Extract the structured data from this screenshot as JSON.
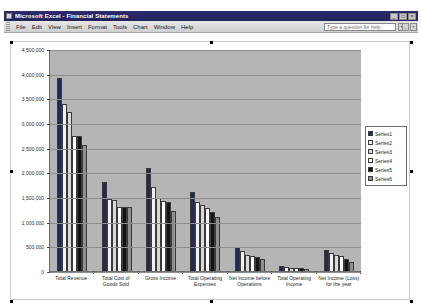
{
  "window": {
    "title": "Microsoft Excel - Financial Statements",
    "app_icon": "excel-icon",
    "minimize_label": "_",
    "restore_label": "□",
    "close_label": "×"
  },
  "menubar": {
    "items": [
      {
        "label": "File"
      },
      {
        "label": "Edit"
      },
      {
        "label": "View"
      },
      {
        "label": "Insert"
      },
      {
        "label": "Format"
      },
      {
        "label": "Tools"
      },
      {
        "label": "Chart"
      },
      {
        "label": "Window"
      },
      {
        "label": "Help"
      }
    ],
    "ask_placeholder": "Type a question for help",
    "ask_value": "Type a question for help",
    "ask_dropdown_glyph": "▾",
    "doc_minimize_label": "_",
    "doc_restore_label": "□",
    "doc_close_label": "×"
  },
  "chart_data": {
    "type": "bar",
    "title": "",
    "xlabel": "",
    "ylabel": "",
    "ylim": [
      0,
      4500000
    ],
    "ytick_step": 500000,
    "grid": true,
    "legend_position": "right",
    "ytick_labels": [
      "4,500,000",
      "4,000,000",
      "3,500,000",
      "3,000,000",
      "2,500,000",
      "2,000,000",
      "1,500,000",
      "1,000,000",
      "500,000",
      "0"
    ],
    "categories": [
      "Total Revenue",
      "Total Cost of Goods Sold",
      "Gross Income",
      "Total Operating Expenses",
      "Net Income before Operations",
      "Total Operating Income",
      "Net Income (Loss) for the year"
    ],
    "series": [
      {
        "name": "Series1",
        "color": "#1f2a55",
        "values": [
          3920000,
          1800000,
          2080000,
          1600000,
          480000,
          95000,
          430000
        ]
      },
      {
        "name": "Series2",
        "color": "#f2f2f2",
        "values": [
          3380000,
          1460000,
          1700000,
          1400000,
          400000,
          80000,
          360000
        ]
      },
      {
        "name": "Series3",
        "color": "#d9d9d9",
        "values": [
          3230000,
          1430000,
          1480000,
          1330000,
          330000,
          70000,
          330000
        ]
      },
      {
        "name": "Series4",
        "color": "#ffffff",
        "values": [
          2740000,
          1300000,
          1420000,
          1280000,
          300000,
          60000,
          300000
        ]
      },
      {
        "name": "Series5",
        "color": "#141414",
        "values": [
          2740000,
          1290000,
          1400000,
          1200000,
          280000,
          55000,
          250000
        ]
      },
      {
        "name": "Series6",
        "color": "#8f8f8f",
        "values": [
          2560000,
          1290000,
          1210000,
          1100000,
          240000,
          50000,
          190000
        ]
      }
    ]
  }
}
